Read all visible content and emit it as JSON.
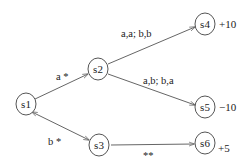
{
  "diagram": {
    "type": "state-transition-tree",
    "colors": {
      "line": "#666666",
      "node_stroke": "#555555",
      "text": "#222222",
      "background": "#ffffff"
    },
    "nodes": [
      {
        "id": "s1",
        "label": "s1",
        "reward": ""
      },
      {
        "id": "s2",
        "label": "s2",
        "reward": ""
      },
      {
        "id": "s3",
        "label": "s3",
        "reward": ""
      },
      {
        "id": "s4",
        "label": "s4",
        "reward": "+10"
      },
      {
        "id": "s5",
        "label": "s5",
        "reward": "−10"
      },
      {
        "id": "s6",
        "label": "s6",
        "reward": "+5"
      }
    ],
    "edges": [
      {
        "from": "s1",
        "to": "s2",
        "label": "a *",
        "bidirectional": false
      },
      {
        "from": "s1",
        "to": "s3",
        "label": "b *",
        "bidirectional": true
      },
      {
        "from": "s2",
        "to": "s4",
        "label": "a,a; b,b",
        "bidirectional": false
      },
      {
        "from": "s2",
        "to": "s5",
        "label": "a,b; b,a",
        "bidirectional": false
      },
      {
        "from": "s3",
        "to": "s6",
        "label": "**",
        "bidirectional": false
      }
    ]
  }
}
